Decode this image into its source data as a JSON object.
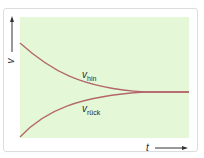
{
  "diagram": {
    "y_axis_label": "v",
    "x_axis_label": "t",
    "curves": [
      {
        "name": "v",
        "subscript": "hin",
        "color": "#b5666a",
        "behavior": "decreasing to equilibrium"
      },
      {
        "name": "v",
        "subscript": "rück",
        "color": "#b5666a",
        "behavior": "increasing to equilibrium"
      }
    ],
    "plot_background": "#e4f8d8"
  }
}
